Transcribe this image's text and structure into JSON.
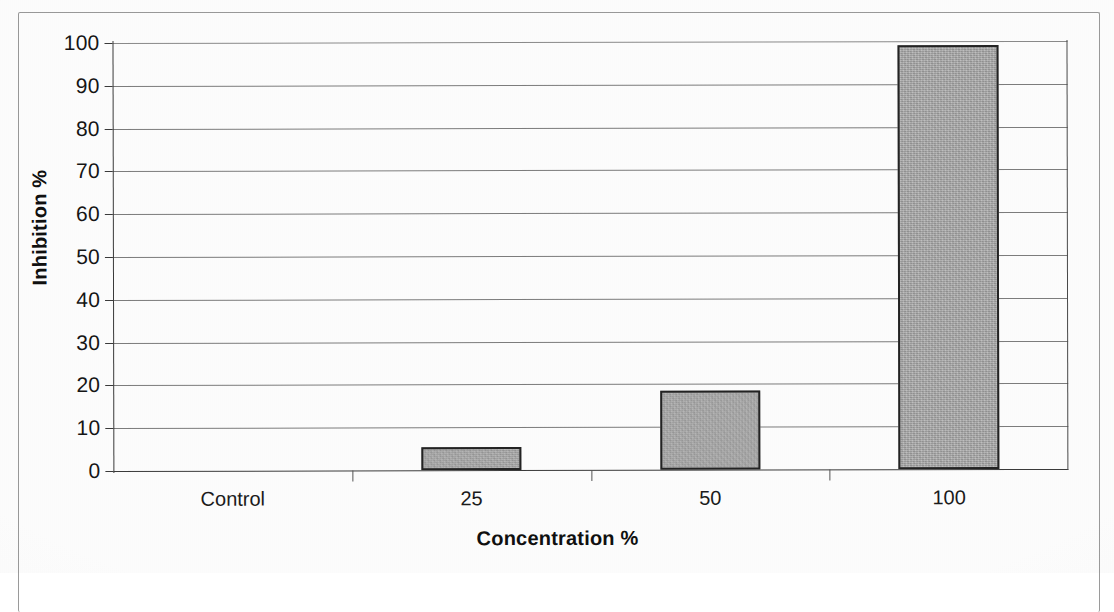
{
  "chart_data": {
    "type": "bar",
    "title": "",
    "subtitle": "",
    "xlabel": "Concentration %",
    "ylabel": "Inhibition %",
    "categories": [
      "Control",
      "25",
      "50",
      "100"
    ],
    "values": [
      0,
      5.3,
      18.5,
      99
    ],
    "ylim": [
      0,
      100
    ],
    "ytick_labels": [
      "100",
      "90",
      "80",
      "70",
      "60",
      "50",
      "40",
      "30",
      "20",
      "10",
      "0"
    ],
    "ytick_values": [
      100,
      90,
      80,
      70,
      60,
      50,
      40,
      30,
      20,
      10,
      0
    ],
    "grid": true,
    "grid_axis": "y",
    "legend": false,
    "legend_position": "none",
    "series": [
      {
        "name": "Inhibition %",
        "values": [
          0,
          5.3,
          18.5,
          99
        ],
        "color": "#a9a9a9",
        "edge_color": "#232323"
      }
    ],
    "annotations": []
  },
  "figure": {
    "border_color": "#9a9a9a",
    "background": "#fefefe",
    "axis_color": "#3b3b3b",
    "gridline_color": "#7d7d7d"
  }
}
